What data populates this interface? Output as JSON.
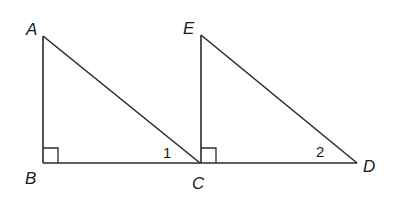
{
  "diagram": {
    "points": {
      "A": {
        "label": "A",
        "x": 43,
        "y": 36
      },
      "B": {
        "label": "B",
        "x": 43,
        "y": 163
      },
      "C": {
        "label": "C",
        "x": 200,
        "y": 163
      },
      "E": {
        "label": "E",
        "x": 201,
        "y": 35
      },
      "D": {
        "label": "D",
        "x": 357,
        "y": 163
      }
    },
    "segments": [
      "AB",
      "BC",
      "AC",
      "EC",
      "CD",
      "ED"
    ],
    "right_angles": [
      "B",
      "ECD"
    ],
    "angle_labels": {
      "angle1": {
        "label": "1",
        "at": "ACB"
      },
      "angle2": {
        "label": "2",
        "at": "EDC"
      }
    }
  }
}
